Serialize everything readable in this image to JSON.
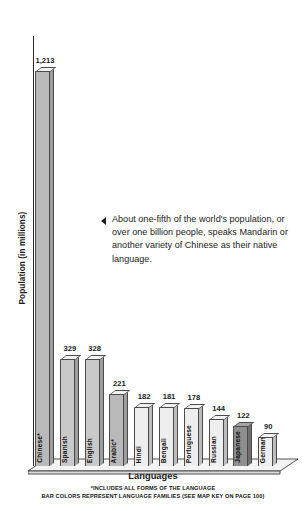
{
  "chart_data": {
    "type": "bar",
    "title": "",
    "xlabel": "Languages",
    "ylabel": "Population (in millions)",
    "categories": [
      "Chinese*",
      "Spanish",
      "English",
      "Arabic*",
      "Hindi",
      "Bengali",
      "Portuguese",
      "Russian",
      "Japanese",
      "German"
    ],
    "values": [
      1213,
      329,
      328,
      221,
      182,
      181,
      178,
      144,
      122,
      90
    ],
    "value_labels": [
      "1,213",
      "329",
      "328",
      "221",
      "182",
      "181",
      "178",
      "144",
      "122",
      "90"
    ],
    "families": [
      "a",
      "b",
      "b",
      "a",
      "d",
      "d",
      "d",
      "d",
      "c",
      "d"
    ],
    "ylim": [
      0,
      1320
    ],
    "grid": false,
    "legend": "none",
    "annotations": [
      "About one-fifth of the world's population, or over one billion people, speaks Mandarin or another variety of Chinese as their native language."
    ],
    "footnotes": [
      "*INCLUDES ALL FORMS OF THE LANGUAGE",
      "BAR COLORS REPRESENT LANGUAGE FAMILIES (SEE MAP KEY ON PAGE 100)"
    ],
    "colors": {
      "fam_a": "#b9b9b9",
      "fam_b": "#c9c9c9",
      "fam_c": "#8e8e8e",
      "fam_d": "#eeeeee",
      "axis": "#2a2a2a",
      "text": "#1a1a1a"
    }
  }
}
